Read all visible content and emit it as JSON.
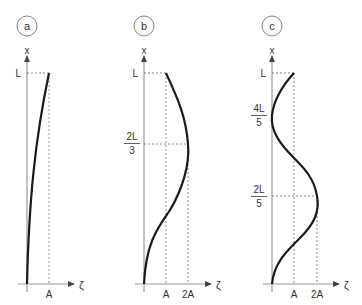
{
  "panels": [
    {
      "id": "a",
      "badge": "a",
      "y_axis_label": "x",
      "x_axis_label": "ζ",
      "y_ticks": [
        "L"
      ],
      "x_ticks": [
        "A"
      ],
      "description": "Monotonic curve from origin to (A, L)"
    },
    {
      "id": "b",
      "badge": "b",
      "y_axis_label": "x",
      "x_axis_label": "ζ",
      "y_ticks": [
        "L",
        "2L/3"
      ],
      "y_tick_fracs": [
        {
          "num": "2L",
          "den": "3"
        }
      ],
      "x_ticks": [
        "A",
        "2A"
      ],
      "description": "Curve from origin reaching max 2A at x=2L/3, ending at (A, L)"
    },
    {
      "id": "c",
      "badge": "c",
      "y_axis_label": "x",
      "x_axis_label": "ζ",
      "y_ticks": [
        "L",
        "4L/5",
        "2L/5"
      ],
      "y_tick_fracs": [
        {
          "num": "4L",
          "den": "5"
        },
        {
          "num": "2L",
          "den": "5"
        }
      ],
      "x_ticks": [
        "A",
        "2A"
      ],
      "description": "Curve from origin reaching max 2A at x=2L/5, returning to 0 at x=4L/5, ending at (A, L)"
    }
  ]
}
